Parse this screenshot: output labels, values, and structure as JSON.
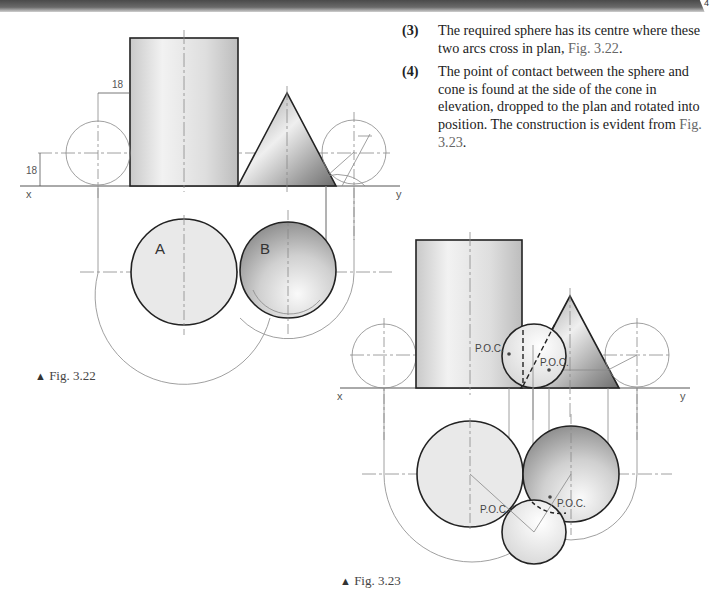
{
  "header": {
    "page_number": "4"
  },
  "steps": [
    {
      "num": "(3)",
      "text": "The required sphere has its centre where these two arcs cross in plan, ",
      "ref": "Fig. 3.22",
      "after": "."
    },
    {
      "num": "(4)",
      "text": "The point of contact between the sphere and cone is found at the side of the cone in elevation, dropped to the plan and rotated into position. The construction is evident from ",
      "ref": "Fig. 3.23",
      "after": "."
    }
  ],
  "fig322": {
    "caption": "Fig. 3.22",
    "dim_horizontal": "18",
    "dim_vertical": "18",
    "x_label": "x",
    "y_label": "y",
    "label_a": "A",
    "label_b": "B"
  },
  "fig323": {
    "caption": "Fig. 3.23",
    "x_label": "x",
    "y_label": "y",
    "poc_labels": [
      "P.O.C.",
      "P.O.C.",
      "P.O.C.",
      "P.O.C."
    ]
  }
}
